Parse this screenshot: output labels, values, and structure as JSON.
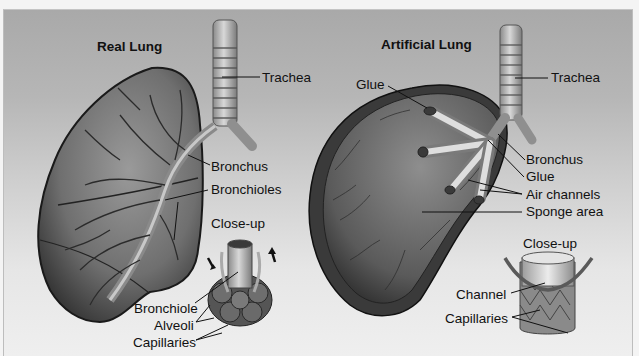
{
  "figure": {
    "panels": [
      {
        "title": "Real Lung",
        "labels": {
          "trachea": "Trachea",
          "bronchus": "Bronchus",
          "bronchioles": "Bronchioles",
          "closeup": "Close-up",
          "bronchiole": "Bronchiole",
          "alveoli": "Alveoli",
          "capillaries": "Capillaries"
        }
      },
      {
        "title": "Artificial Lung",
        "labels": {
          "glue_top": "Glue",
          "trachea": "Trachea",
          "bronchus": "Bronchus",
          "glue": "Glue",
          "air_channels": "Air channels",
          "sponge_area": "Sponge area",
          "closeup": "Close-up",
          "channel": "Channel",
          "capillaries": "Capillaries"
        }
      }
    ],
    "colors": {
      "background_top": "#a9a9a9",
      "background_bottom": "#efefef",
      "ink": "#111111"
    }
  }
}
